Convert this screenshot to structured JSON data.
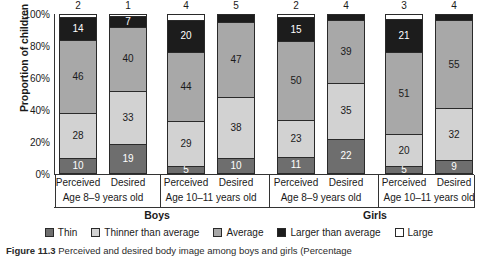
{
  "chart_data": {
    "type": "bar",
    "subtype": "stacked-percentage",
    "title": "",
    "xlabel": "",
    "ylabel": "Proportion of children",
    "ylim": [
      0,
      100
    ],
    "ytick_labels": [
      "0%",
      "20%",
      "40%",
      "60%",
      "80%",
      "100%"
    ],
    "ytick_values": [
      0,
      20,
      40,
      60,
      80,
      100
    ],
    "grid": false,
    "legend_position": "bottom",
    "categories": [
      "Perceived",
      "Desired",
      "Perceived",
      "Desired",
      "Perceived",
      "Desired",
      "Perceived",
      "Desired"
    ],
    "group_labels": [
      "Age 8–9 years old",
      "Age 10–11 years old",
      "Age 8–9 years old",
      "Age 10–11 years old"
    ],
    "super_group_labels": [
      "Boys",
      "Girls"
    ],
    "series": [
      {
        "name": "Thin",
        "color": "#6e6e6e",
        "text_color": "#ffffff",
        "values": [
          10,
          19,
          5,
          10,
          11,
          22,
          5,
          9
        ]
      },
      {
        "name": "Thinner than average",
        "color": "#d2d2d2",
        "text_color": "#1a1a1a",
        "values": [
          28,
          33,
          29,
          38,
          23,
          35,
          20,
          32
        ]
      },
      {
        "name": "Average",
        "color": "#a8a8a8",
        "text_color": "#1a1a1a",
        "values": [
          46,
          40,
          44,
          47,
          50,
          39,
          51,
          55
        ]
      },
      {
        "name": "Larger than average",
        "color": "#1c1c1c",
        "text_color": "#ffffff",
        "values": [
          14,
          7,
          20,
          5,
          15,
          4,
          21,
          4
        ]
      },
      {
        "name": "Large",
        "color": "#ffffff",
        "text_color": "#1a1a1a",
        "values": [
          2,
          1,
          4,
          0,
          2,
          0,
          3,
          0
        ]
      }
    ],
    "top_labels": [
      "2",
      "1",
      "4",
      "5",
      "2",
      "4",
      "3",
      "4"
    ],
    "bar_value_labels": [
      [
        "10",
        "28",
        "46",
        "14",
        ""
      ],
      [
        "19",
        "33",
        "40",
        "7",
        ""
      ],
      [
        "5",
        "29",
        "44",
        "20",
        ""
      ],
      [
        "10",
        "38",
        "47",
        "",
        ""
      ],
      [
        "11",
        "23",
        "50",
        "15",
        ""
      ],
      [
        "22",
        "35",
        "39",
        "",
        ""
      ],
      [
        "5",
        "20",
        "51",
        "21",
        ""
      ],
      [
        "9",
        "32",
        "55",
        "",
        ""
      ]
    ]
  },
  "caption": {
    "number": "Figure 11.3",
    "text": "Perceived and desired body image among boys and girls (Percentage"
  }
}
